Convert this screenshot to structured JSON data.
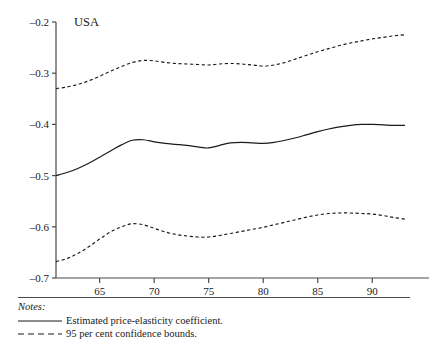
{
  "panel": {
    "title": "USA"
  },
  "notes": {
    "heading": "Notes:",
    "legend": [
      {
        "style": "solid",
        "sample": "solid-line-sample",
        "label": "Estimated price-elasticity coefficient."
      },
      {
        "style": "dashed",
        "sample": "dashed-line-sample",
        "label": "95 per cent confidence bounds."
      }
    ]
  },
  "chart_data": {
    "type": "line",
    "title": "USA",
    "xlabel": "",
    "ylabel": "",
    "xlim": [
      61,
      93
    ],
    "ylim": [
      -0.7,
      -0.2
    ],
    "grid": false,
    "legend_position": "below-figure",
    "xticks": [
      65,
      70,
      75,
      80,
      85,
      90
    ],
    "xtick_labels": [
      "65",
      "70",
      "75",
      "80",
      "85",
      "90"
    ],
    "yticks": [
      -0.2,
      -0.3,
      -0.4,
      -0.5,
      -0.6,
      -0.7
    ],
    "ytick_labels": [
      "–0.2",
      "–0.3",
      "–0.4",
      "–0.5",
      "–0.6",
      "–0.7"
    ],
    "x": [
      61,
      62,
      63,
      64,
      65,
      66,
      67,
      68,
      69,
      70,
      71,
      72,
      73,
      74,
      75,
      76,
      77,
      78,
      79,
      80,
      81,
      82,
      83,
      84,
      85,
      86,
      87,
      88,
      89,
      90,
      91,
      92,
      93
    ],
    "series": [
      {
        "name": "Estimated price-elasticity coefficient.",
        "style": "solid",
        "color": "#1a1a1a",
        "values": [
          -0.5,
          -0.494,
          -0.486,
          -0.476,
          -0.464,
          -0.452,
          -0.44,
          -0.431,
          -0.43,
          -0.434,
          -0.437,
          -0.439,
          -0.441,
          -0.444,
          -0.446,
          -0.441,
          -0.436,
          -0.435,
          -0.436,
          -0.437,
          -0.435,
          -0.431,
          -0.426,
          -0.42,
          -0.414,
          -0.409,
          -0.405,
          -0.402,
          -0.4,
          -0.4,
          -0.401,
          -0.402,
          -0.402
        ]
      },
      {
        "name": "95 per cent upper confidence bound",
        "style": "dashed",
        "color": "#1a1a1a",
        "values": [
          -0.33,
          -0.327,
          -0.322,
          -0.315,
          -0.306,
          -0.296,
          -0.287,
          -0.279,
          -0.275,
          -0.276,
          -0.279,
          -0.281,
          -0.282,
          -0.283,
          -0.284,
          -0.282,
          -0.281,
          -0.282,
          -0.284,
          -0.286,
          -0.284,
          -0.279,
          -0.272,
          -0.265,
          -0.258,
          -0.252,
          -0.246,
          -0.241,
          -0.237,
          -0.233,
          -0.23,
          -0.227,
          -0.225
        ]
      },
      {
        "name": "95 per cent lower confidence bound",
        "style": "dashed",
        "color": "#1a1a1a",
        "values": [
          -0.668,
          -0.662,
          -0.652,
          -0.639,
          -0.624,
          -0.61,
          -0.6,
          -0.594,
          -0.596,
          -0.603,
          -0.61,
          -0.615,
          -0.618,
          -0.62,
          -0.62,
          -0.617,
          -0.613,
          -0.609,
          -0.605,
          -0.601,
          -0.596,
          -0.591,
          -0.586,
          -0.581,
          -0.577,
          -0.574,
          -0.573,
          -0.573,
          -0.574,
          -0.575,
          -0.578,
          -0.582,
          -0.585
        ]
      }
    ]
  }
}
